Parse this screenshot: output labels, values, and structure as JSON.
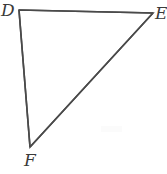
{
  "figure": {
    "kind": "geometry-diagram",
    "shape": "triangle",
    "name": "Triangle DEF",
    "canvas": {
      "width": 167,
      "height": 174
    },
    "background_color": "#ffffff",
    "stroke_color": "#4a4a4a",
    "stroke_width": 1.6,
    "label_color": "#3a3a3a",
    "label_font_size": 17,
    "label_style": "italic",
    "vertices": [
      {
        "id": "D",
        "label": "D",
        "x": 19,
        "y": 10,
        "label_x": 1,
        "label_y": 2,
        "position": "top-left"
      },
      {
        "id": "E",
        "label": "E",
        "x": 153,
        "y": 13,
        "label_x": 155,
        "label_y": 5,
        "position": "top-right"
      },
      {
        "id": "F",
        "label": "F",
        "x": 30,
        "y": 147,
        "label_x": 24,
        "label_y": 152,
        "position": "bottom-left"
      }
    ],
    "edges": [
      {
        "id": "DE",
        "from": "D",
        "to": "E",
        "label": ""
      },
      {
        "id": "EF",
        "from": "E",
        "to": "F",
        "label": ""
      },
      {
        "id": "FD",
        "from": "F",
        "to": "D",
        "label": ""
      }
    ],
    "artifact": {
      "name": "scan-smudge",
      "x": 101,
      "y": 126,
      "width": 21,
      "height": 6,
      "color": "#fbfbfb"
    }
  }
}
